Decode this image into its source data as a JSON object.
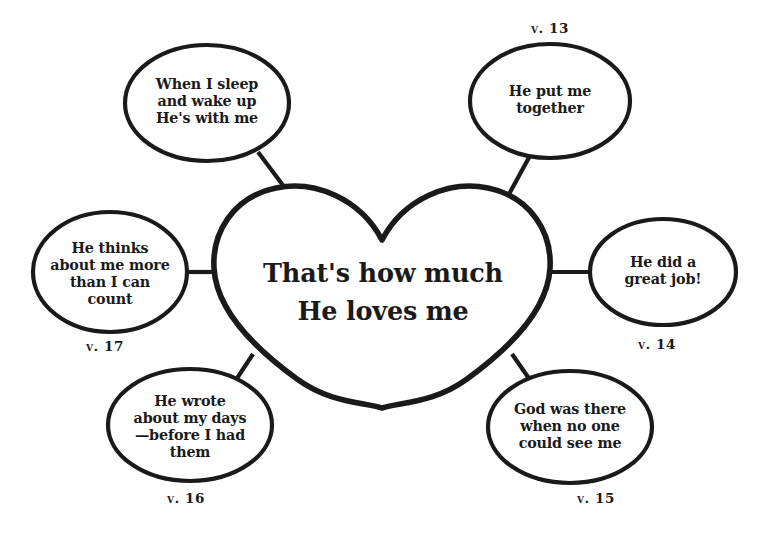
{
  "worksheet": {
    "title": "That's how much He loves me",
    "center": {
      "shape": "heart",
      "line1": "That's how much",
      "line2": "He loves me"
    },
    "bubbles": [
      {
        "id": "bubble-when-i-sleep",
        "position": "top-left",
        "lines": [
          "When I sleep",
          "and wake up",
          "He's with me"
        ],
        "verse": ""
      },
      {
        "id": "bubble-he-put-me-together",
        "position": "top-right",
        "lines": [
          "He put me",
          "together"
        ],
        "verse": "v. 13"
      },
      {
        "id": "bubble-he-thinks-about-me",
        "position": "left",
        "lines": [
          "He thinks",
          "about me more",
          "than I can",
          "count"
        ],
        "verse": "v. 17"
      },
      {
        "id": "bubble-he-did-a-great-job",
        "position": "right",
        "lines": [
          "He did a",
          "great job!"
        ],
        "verse": "v. 14"
      },
      {
        "id": "bubble-he-wrote-about-my-days",
        "position": "bottom-left",
        "lines": [
          "He wrote",
          "about my days",
          "—before I had",
          "them"
        ],
        "verse": "v. 16"
      },
      {
        "id": "bubble-god-was-there",
        "position": "bottom-right",
        "lines": [
          "God was there",
          "when no one",
          "could see me"
        ],
        "verse": "v. 15"
      }
    ],
    "colors": {
      "ink": "#1a1a1a",
      "paper": "#ffffff"
    }
  }
}
